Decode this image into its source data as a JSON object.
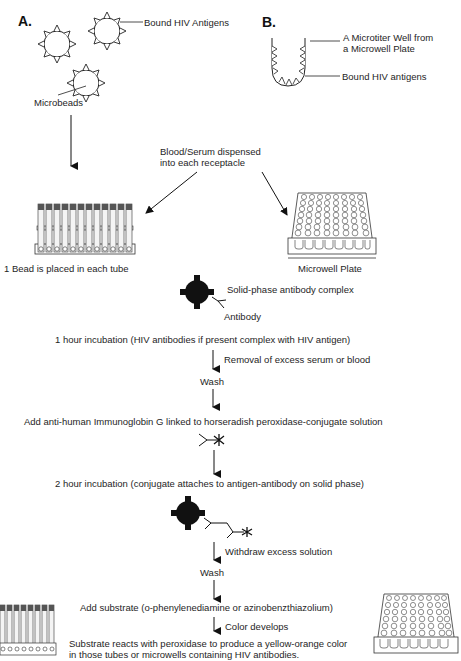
{
  "panel_a": {
    "label": "A.",
    "bound_antigens": "Bound HIV Antigens",
    "microbeads": "Microbeads"
  },
  "panel_b": {
    "label": "B.",
    "well_line1": "A Microtiter Well from",
    "well_line2": "a Microwell Plate",
    "bound_antigens": "Bound HIV antigens"
  },
  "dispense": {
    "line1": "Blood/Serum dispensed",
    "line2": "into each receptacle"
  },
  "tubes_caption": "1 Bead is placed in each tube",
  "plate_caption": "Microwell Plate",
  "steps": {
    "solid_phase": "Solid-phase antibody complex",
    "antibody": "Antibody",
    "incubation1": "1 hour incubation (HIV antibodies if present complex with HIV antigen)",
    "removal": "Removal of excess serum or blood",
    "wash1": "Wash",
    "add_conjugate": "Add anti-human Immunoglobin G linked to horseradish peroxidase-conjugate solution",
    "incubation2": "2 hour incubation (conjugate attaches to antigen-antibody on solid phase)",
    "withdraw": "Withdraw excess solution",
    "wash2": "Wash",
    "add_substrate": "Add substrate (o-phenylenediamine or azinobenzthiazolium)",
    "color_develops": "Color develops",
    "result_line1": "Substrate reacts with peroxidase to produce a yellow-orange color",
    "result_line2": "in those tubes or microwells containing HIV antibodies."
  }
}
